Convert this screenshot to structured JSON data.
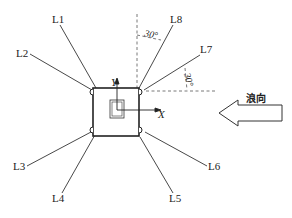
{
  "diagram": {
    "lines": [
      {
        "id": "L1",
        "label": "L1"
      },
      {
        "id": "L2",
        "label": "L2"
      },
      {
        "id": "L3",
        "label": "L3"
      },
      {
        "id": "L4",
        "label": "L4"
      },
      {
        "id": "L5",
        "label": "L5"
      },
      {
        "id": "L6",
        "label": "L6"
      },
      {
        "id": "L7",
        "label": "L7"
      },
      {
        "id": "L8",
        "label": "L8"
      }
    ],
    "angles": {
      "upper": "30°",
      "lower": "30°"
    },
    "axes": {
      "x": "X",
      "y": "Y"
    },
    "wave_direction": {
      "label": "浪向"
    },
    "colors": {
      "line": "#333333",
      "dashed": "#555555",
      "background": "#ffffff"
    }
  }
}
